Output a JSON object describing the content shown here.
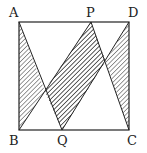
{
  "diagram": {
    "type": "geometry",
    "shape": "square",
    "points": {
      "A": {
        "label": "A",
        "x": 19,
        "y": 22
      },
      "P": {
        "label": "P",
        "x": 91,
        "y": 22
      },
      "D": {
        "label": "D",
        "x": 129,
        "y": 22
      },
      "B": {
        "label": "B",
        "x": 19,
        "y": 130
      },
      "Q": {
        "label": "Q",
        "x": 62,
        "y": 130
      },
      "C": {
        "label": "C",
        "x": 129,
        "y": 130
      }
    },
    "shaded_regions": [
      "triangle ABQ-region",
      "parallelogram BQDP",
      "triangle PDC-region"
    ],
    "segments": [
      "AB",
      "AD",
      "BC",
      "CD",
      "AQ",
      "BP",
      "PQ",
      "PC",
      "QD"
    ]
  }
}
